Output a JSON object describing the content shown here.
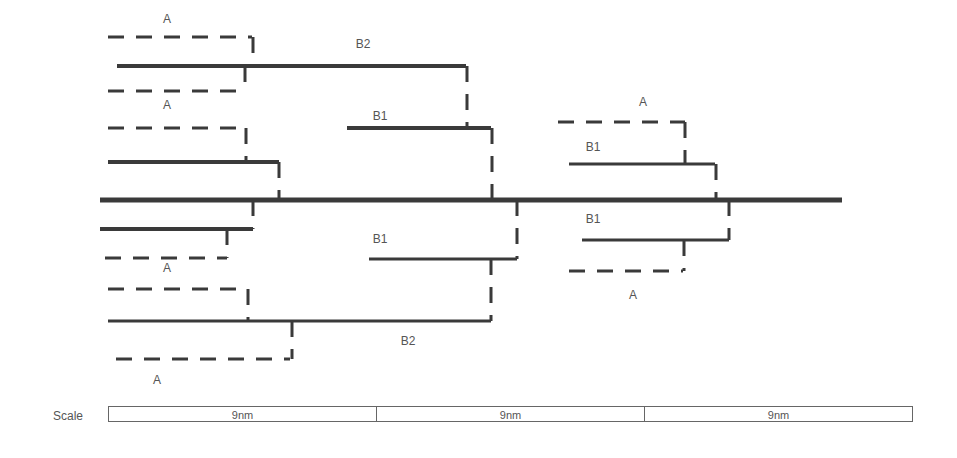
{
  "diagram": {
    "stroke_color": "#3a3a3a",
    "labels": [
      {
        "text": "A",
        "x": 167,
        "y": 19
      },
      {
        "text": "B2",
        "x": 363,
        "y": 44
      },
      {
        "text": "A",
        "x": 167,
        "y": 105
      },
      {
        "text": "B1",
        "x": 380,
        "y": 116
      },
      {
        "text": "A",
        "x": 643,
        "y": 102
      },
      {
        "text": "B1",
        "x": 593,
        "y": 147
      },
      {
        "text": "B1",
        "x": 593,
        "y": 219
      },
      {
        "text": "B1",
        "x": 380,
        "y": 239
      },
      {
        "text": "A",
        "x": 167,
        "y": 268
      },
      {
        "text": "A",
        "x": 633,
        "y": 295
      },
      {
        "text": "B2",
        "x": 408,
        "y": 341
      },
      {
        "text": "A",
        "x": 157,
        "y": 380
      }
    ],
    "solid_lines": [
      {
        "name": "main-axis",
        "x1": 100,
        "y1": 200,
        "x2": 842,
        "y2": 200,
        "w": 5
      },
      {
        "name": "b2-upper",
        "x1": 117,
        "y1": 66,
        "x2": 466,
        "y2": 66,
        "w": 4
      },
      {
        "name": "b1-upper-left",
        "x1": 347,
        "y1": 128,
        "x2": 491,
        "y2": 128,
        "w": 4
      },
      {
        "name": "upper-inner-left",
        "x1": 108,
        "y1": 162,
        "x2": 279,
        "y2": 162,
        "w": 4
      },
      {
        "name": "lower-inner-left",
        "x1": 100,
        "y1": 229,
        "x2": 253,
        "y2": 229,
        "w": 4
      },
      {
        "name": "b1-lower-left",
        "x1": 369,
        "y1": 259,
        "x2": 517,
        "y2": 259,
        "w": 3
      },
      {
        "name": "b2-lower",
        "x1": 108,
        "y1": 321,
        "x2": 491,
        "y2": 321,
        "w": 3
      },
      {
        "name": "b1-upper-right",
        "x1": 569,
        "y1": 164,
        "x2": 715,
        "y2": 164,
        "w": 3
      },
      {
        "name": "b1-lower-right",
        "x1": 582,
        "y1": 240,
        "x2": 729,
        "y2": 240,
        "w": 3
      }
    ],
    "dashed_lines": [
      {
        "name": "a-top-1",
        "x1": 108,
        "y1": 37,
        "x2": 252,
        "y2": 37
      },
      {
        "name": "a-top-1-v",
        "x1": 253,
        "y1": 37,
        "x2": 253,
        "y2": 66
      },
      {
        "name": "a-top-2",
        "x1": 108,
        "y1": 91,
        "x2": 243,
        "y2": 91
      },
      {
        "name": "a-top-2-v",
        "x1": 245,
        "y1": 66,
        "x2": 245,
        "y2": 91
      },
      {
        "name": "b2-to-b1-v",
        "x1": 467,
        "y1": 66,
        "x2": 467,
        "y2": 128
      },
      {
        "name": "a-mid-up",
        "x1": 108,
        "y1": 128,
        "x2": 246,
        "y2": 128
      },
      {
        "name": "a-mid-up-v",
        "x1": 246,
        "y1": 128,
        "x2": 246,
        "y2": 162
      },
      {
        "name": "inner-up-v",
        "x1": 279,
        "y1": 162,
        "x2": 279,
        "y2": 200
      },
      {
        "name": "b1-ul-v",
        "x1": 492,
        "y1": 128,
        "x2": 492,
        "y2": 200
      },
      {
        "name": "inner-low-v",
        "x1": 253,
        "y1": 200,
        "x2": 253,
        "y2": 229
      },
      {
        "name": "a-mid-low",
        "x1": 105,
        "y1": 258,
        "x2": 227,
        "y2": 258
      },
      {
        "name": "a-mid-low-v",
        "x1": 227,
        "y1": 229,
        "x2": 227,
        "y2": 258
      },
      {
        "name": "b1-ll-v",
        "x1": 517,
        "y1": 200,
        "x2": 517,
        "y2": 259
      },
      {
        "name": "b1-to-b2-v",
        "x1": 491,
        "y1": 259,
        "x2": 491,
        "y2": 321
      },
      {
        "name": "a-low-1",
        "x1": 108,
        "y1": 289,
        "x2": 237,
        "y2": 289
      },
      {
        "name": "a-low-1-v",
        "x1": 248,
        "y1": 289,
        "x2": 248,
        "y2": 321
      },
      {
        "name": "a-low-2",
        "x1": 116,
        "y1": 359,
        "x2": 290,
        "y2": 359
      },
      {
        "name": "a-low-2-v",
        "x1": 292,
        "y1": 321,
        "x2": 292,
        "y2": 359
      },
      {
        "name": "a-right-up",
        "x1": 558,
        "y1": 122,
        "x2": 685,
        "y2": 122
      },
      {
        "name": "a-right-up-v",
        "x1": 685,
        "y1": 122,
        "x2": 685,
        "y2": 164
      },
      {
        "name": "b1-ur-v",
        "x1": 716,
        "y1": 164,
        "x2": 716,
        "y2": 200
      },
      {
        "name": "b1-lr-v",
        "x1": 729,
        "y1": 200,
        "x2": 729,
        "y2": 240
      },
      {
        "name": "a-right-low-v",
        "x1": 684,
        "y1": 240,
        "x2": 684,
        "y2": 271
      },
      {
        "name": "a-right-low",
        "x1": 569,
        "y1": 271,
        "x2": 683,
        "y2": 271
      }
    ]
  },
  "scale": {
    "title": "Scale",
    "segments": [
      "9nm",
      "9nm",
      "9nm"
    ]
  }
}
